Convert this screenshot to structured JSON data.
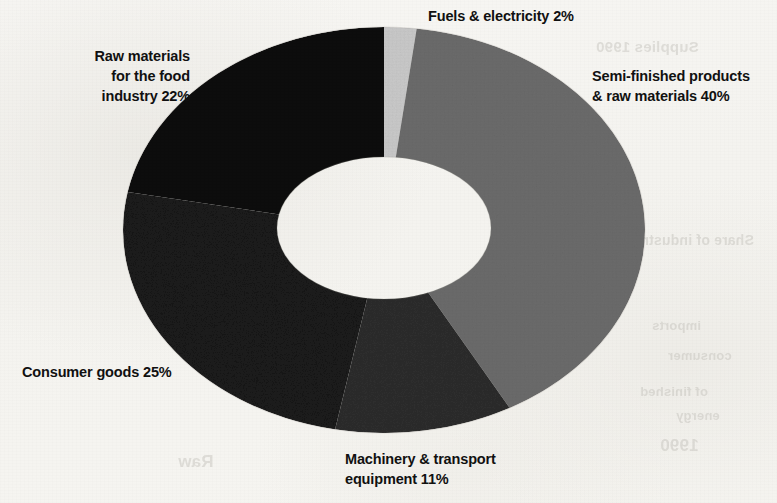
{
  "page": {
    "background_color": "#f6f5f2",
    "text_color": "#111111"
  },
  "chart_data": {
    "type": "pie",
    "variant": "donut",
    "title": "",
    "subtitle": "",
    "xlabel": "",
    "ylabel": "",
    "legend_position": "none",
    "labels_position": "outside-around-chart",
    "grid": false,
    "units": "percent",
    "total": 100,
    "start_angle_deg": 0,
    "direction": "clockwise",
    "categories": [
      "Fuels & electricity",
      "Semi-finished products & raw materials",
      "Machinery & transport equipment",
      "Consumer goods",
      "Raw materials for the food industry"
    ],
    "values": [
      2,
      40,
      11,
      25,
      22
    ],
    "colors": [
      "#c9c9c9",
      "#6b6b6b",
      "#2d2d2d",
      "#1a1a1a",
      "#0d0d0d"
    ],
    "slices": [
      {
        "name": "Fuels & electricity",
        "value": 2,
        "display": "Fuels & electricity 2%",
        "color": "#c9c9c9",
        "label_lines": [
          "Fuels & electricity 2%"
        ]
      },
      {
        "name": "Semi-finished products & raw materials",
        "value": 40,
        "display": "Semi-finished products & raw materials 40%",
        "color": "#6b6b6b",
        "label_lines": [
          "Semi-finished products",
          "& raw materials 40%"
        ]
      },
      {
        "name": "Machinery & transport equipment",
        "value": 11,
        "display": "Machinery & transport equipment 11%",
        "color": "#2d2d2d",
        "label_lines": [
          "Machinery & transport",
          "equipment 11%"
        ]
      },
      {
        "name": "Consumer goods",
        "value": 25,
        "display": "Consumer goods 25%",
        "color": "#1a1a1a",
        "label_lines": [
          "Consumer goods 25%"
        ]
      },
      {
        "name": "Raw materials for the food industry",
        "value": 22,
        "display": "Raw materials for the food industry 22%",
        "color": "#0d0d0d",
        "label_lines": [
          "Raw materials",
          "for the food",
          "industry 22%"
        ]
      }
    ]
  },
  "labels": {
    "fuels": "Fuels & electricity 2%",
    "semifinished": "Semi-finished products\n& raw materials 40%",
    "rawmaterials": "Raw materials\nfor the food\nindustry 22%",
    "consumer": "Consumer goods 25%",
    "machinery": "Machinery & transport\nequipment 11%"
  },
  "ghost_text": {
    "a": "Supplies 1990",
    "b": "Share of industrial production",
    "c": "imports",
    "d": "consumer",
    "e": "of finished",
    "f": "energy",
    "g": "1990",
    "h": "Raw"
  }
}
